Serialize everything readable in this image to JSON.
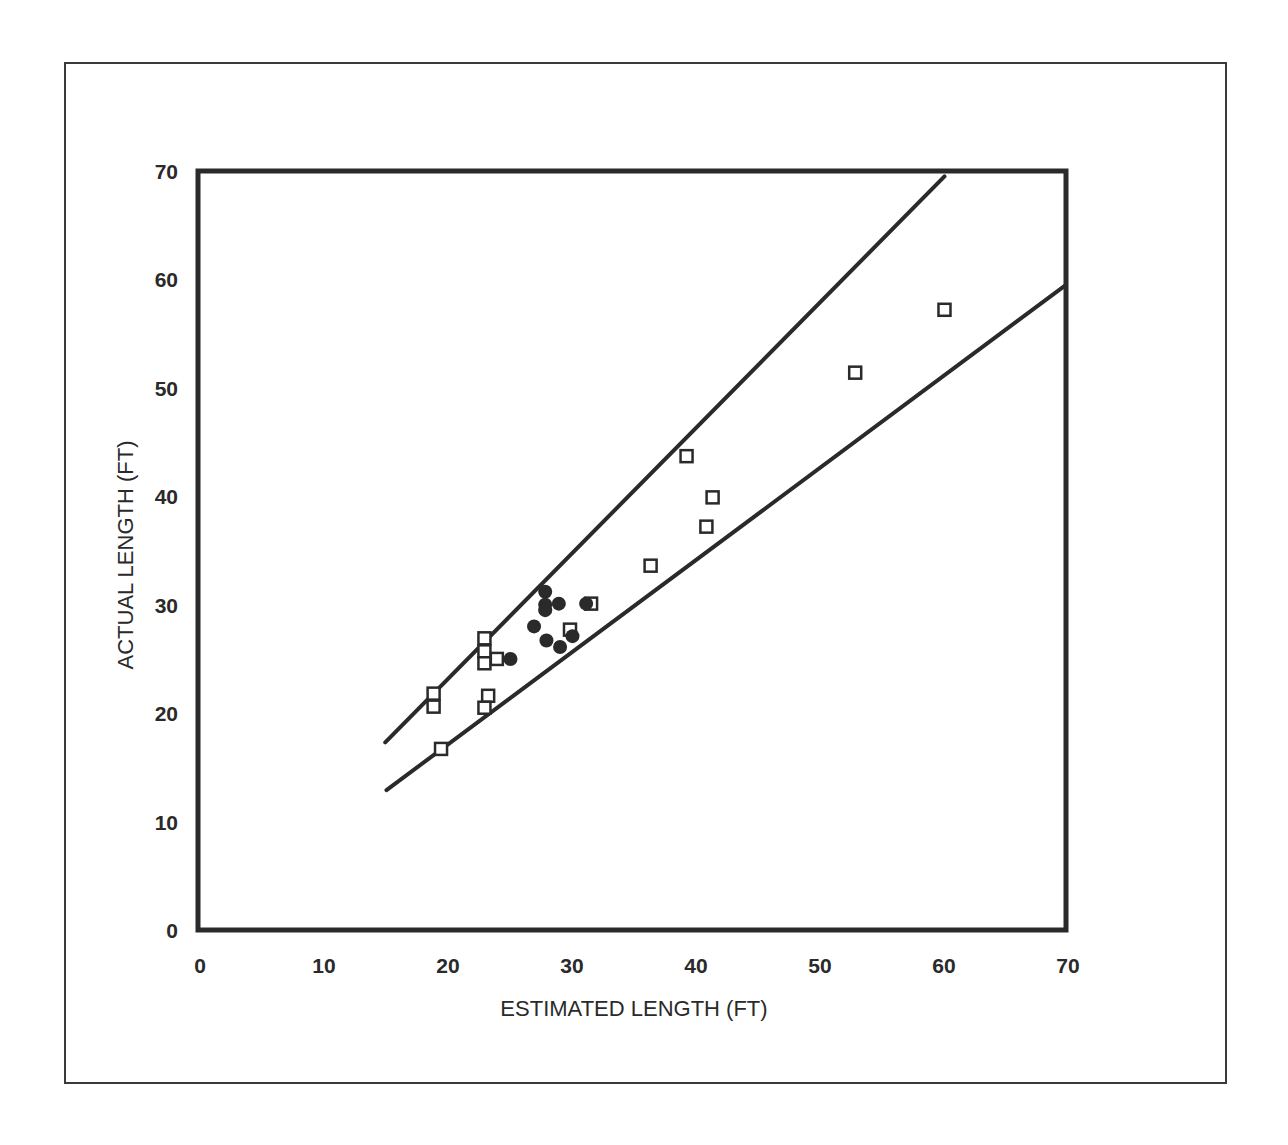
{
  "chart_data": {
    "type": "scatter",
    "title": "",
    "xlabel": "ESTIMATED LENGTH (FT)",
    "ylabel": "ACTUAL LENGTH (FT)",
    "xlim": [
      0,
      70
    ],
    "ylim": [
      0,
      70
    ],
    "xticks": [
      0,
      10,
      20,
      30,
      40,
      50,
      60,
      70
    ],
    "yticks": [
      0,
      10,
      20,
      30,
      40,
      50,
      60,
      70
    ],
    "grid": false,
    "legend": null,
    "series": [
      {
        "name": "open squares",
        "marker": "open-square",
        "points": [
          [
            19.0,
            21.8
          ],
          [
            19.0,
            20.6
          ],
          [
            19.6,
            16.7
          ],
          [
            23.1,
            26.9
          ],
          [
            23.1,
            25.7
          ],
          [
            23.1,
            24.6
          ],
          [
            24.1,
            25.0
          ],
          [
            23.4,
            21.6
          ],
          [
            23.1,
            20.5
          ],
          [
            30.0,
            27.7
          ],
          [
            31.7,
            30.1
          ],
          [
            36.5,
            33.6
          ],
          [
            39.4,
            43.7
          ],
          [
            41.5,
            39.9
          ],
          [
            41.0,
            37.2
          ],
          [
            53.0,
            51.4
          ],
          [
            60.2,
            57.2
          ]
        ]
      },
      {
        "name": "filled circles",
        "marker": "filled-circle",
        "points": [
          [
            25.2,
            25.0
          ],
          [
            27.1,
            28.0
          ],
          [
            28.0,
            31.2
          ],
          [
            28.0,
            30.0
          ],
          [
            28.0,
            29.5
          ],
          [
            29.1,
            30.1
          ],
          [
            28.1,
            26.7
          ],
          [
            29.2,
            26.1
          ],
          [
            30.2,
            27.1
          ],
          [
            31.3,
            30.1
          ]
        ]
      }
    ],
    "lines": [
      {
        "name": "upper bound",
        "slope": 1.15,
        "x_range": [
          15.1,
          60.2
        ],
        "y_range": [
          17.3,
          69.5
        ]
      },
      {
        "name": "lower bound",
        "slope": 0.85,
        "x_range": [
          15.2,
          70
        ],
        "y_range": [
          12.9,
          59.5
        ]
      }
    ]
  }
}
